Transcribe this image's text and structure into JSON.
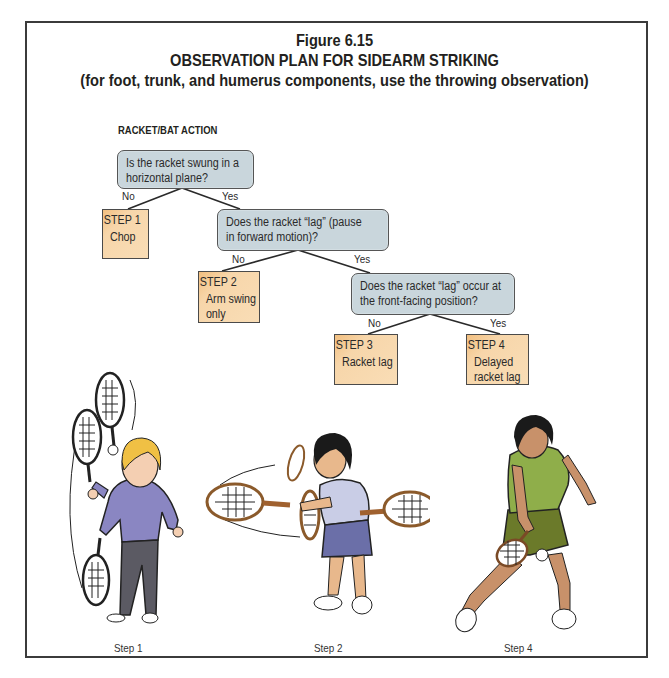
{
  "figure": {
    "number": "Figure 6.15",
    "title": "OBSERVATION PLAN FOR SIDEARM STRIKING",
    "subtitle": "(for foot, trunk, and humerus components, use the throwing observation)"
  },
  "section_label": "RACKET/BAT ACTION",
  "questions": [
    {
      "id": "q1",
      "lines": [
        "Is the racket swung in a",
        "horizontal plane?"
      ]
    },
    {
      "id": "q2",
      "lines": [
        "Does the racket “lag” (pause",
        "in forward motion)?"
      ]
    },
    {
      "id": "q3",
      "lines": [
        "Does the racket “lag” occur at",
        "the front-facing position?"
      ]
    }
  ],
  "branches": {
    "q1_no": "No",
    "q1_yes": "Yes",
    "q2_no": "No",
    "q2_yes": "Yes",
    "q3_no": "No",
    "q3_yes": "Yes"
  },
  "steps": [
    {
      "header": "STEP 1",
      "lines": [
        "Chop"
      ]
    },
    {
      "header": "STEP 2",
      "lines": [
        "Arm swing",
        "only"
      ]
    },
    {
      "header": "STEP 3",
      "lines": [
        "Racket lag"
      ]
    },
    {
      "header": "STEP 4",
      "lines": [
        "Delayed",
        "racket lag"
      ]
    }
  ],
  "illustrations": [
    {
      "caption": "Step 1",
      "description": "child in purple shirt swinging racket in vertical chopping arc"
    },
    {
      "caption": "Step 2",
      "description": "child in blue shirt swinging racket horizontally with arm only"
    },
    {
      "caption": "Step 4",
      "description": "girl in green shirt and shorts with delayed racket lag forehand"
    }
  ],
  "colors": {
    "question_fill": "#c9d6dc",
    "step_fill": "#f7d6aa",
    "step_fill_dark": "#f2bf80",
    "frame": "#3b3b3b",
    "text": "#231f20"
  }
}
